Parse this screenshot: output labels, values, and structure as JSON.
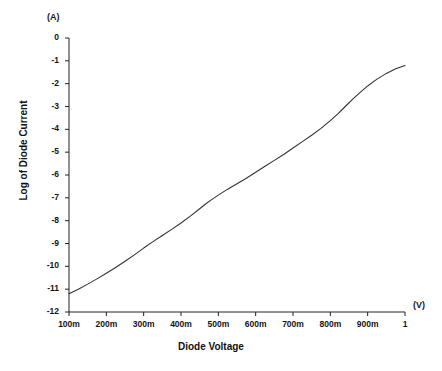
{
  "chart_data": {
    "type": "line",
    "title": "",
    "subtitle": "",
    "xlabel": "Diode Voltage",
    "ylabel": "Log of Diode Current",
    "x_unit_label": "(V)",
    "y_unit_label": "(A)",
    "xlim": [
      0.1,
      1.0
    ],
    "ylim": [
      -12,
      0
    ],
    "grid": false,
    "legend": null,
    "legend_position": "none",
    "x_tick_labels": [
      "100m",
      "200m",
      "300m",
      "400m",
      "500m",
      "600m",
      "700m",
      "800m",
      "900m",
      "1"
    ],
    "x_tick_values": [
      0.1,
      0.2,
      0.3,
      0.4,
      0.5,
      0.6,
      0.7,
      0.8,
      0.9,
      1.0
    ],
    "y_tick_labels": [
      "0",
      "-1",
      "-2",
      "-3",
      "-4",
      "-5",
      "-6",
      "-7",
      "-8",
      "-9",
      "-10",
      "-11",
      "-12"
    ],
    "y_tick_values": [
      0,
      -1,
      -2,
      -3,
      -4,
      -5,
      -6,
      -7,
      -8,
      -9,
      -10,
      -11,
      -12
    ],
    "series": [
      {
        "name": "Diode I-V characteristic",
        "color": "#333333",
        "line_width": 1,
        "x": [
          0.1,
          0.125,
          0.15,
          0.175,
          0.2,
          0.225,
          0.25,
          0.275,
          0.3,
          0.325,
          0.35,
          0.375,
          0.4,
          0.425,
          0.45,
          0.465,
          0.48,
          0.5,
          0.525,
          0.55,
          0.575,
          0.6,
          0.625,
          0.65,
          0.675,
          0.7,
          0.725,
          0.75,
          0.775,
          0.8,
          0.82,
          0.84,
          0.86,
          0.88,
          0.9,
          0.925,
          0.95,
          0.975,
          1.0
        ],
        "y": [
          -11.2,
          -11.0,
          -10.78,
          -10.55,
          -10.3,
          -10.05,
          -9.78,
          -9.5,
          -9.2,
          -8.92,
          -8.65,
          -8.38,
          -8.1,
          -7.8,
          -7.48,
          -7.28,
          -7.1,
          -6.88,
          -6.62,
          -6.38,
          -6.14,
          -5.88,
          -5.62,
          -5.36,
          -5.1,
          -4.82,
          -4.54,
          -4.26,
          -3.96,
          -3.62,
          -3.32,
          -3.0,
          -2.68,
          -2.38,
          -2.1,
          -1.8,
          -1.55,
          -1.35,
          -1.2
        ]
      }
    ]
  },
  "axes": {
    "x_unit": "(V)",
    "y_unit": "(A)",
    "x_title": "Diode Voltage",
    "y_title": "Log of Diode Current"
  }
}
